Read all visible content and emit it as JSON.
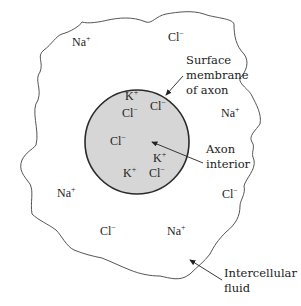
{
  "diagram": {
    "colors": {
      "outline": "#555555",
      "membrane": "#2a2a2a",
      "interior_fill": "#d6d6d6",
      "text": "#222222",
      "background": "#ffffff"
    },
    "extracellular_ions": [
      {
        "base": "Na",
        "charge": "+",
        "x": 72,
        "y": 46
      },
      {
        "base": "Cl",
        "charge": "−",
        "x": 168,
        "y": 41
      },
      {
        "base": "Na",
        "charge": "+",
        "x": 221,
        "y": 117
      },
      {
        "base": "Na",
        "charge": "+",
        "x": 57,
        "y": 197
      },
      {
        "base": "Cl",
        "charge": "−",
        "x": 100,
        "y": 235
      },
      {
        "base": "Na",
        "charge": "+",
        "x": 167,
        "y": 235
      },
      {
        "base": "Cl",
        "charge": "−",
        "x": 222,
        "y": 198
      }
    ],
    "intracellular_ions": [
      {
        "base": "K",
        "charge": "+",
        "x": 125,
        "y": 100
      },
      {
        "base": "Cl",
        "charge": "−",
        "x": 150,
        "y": 110
      },
      {
        "base": "Cl",
        "charge": "−",
        "x": 122,
        "y": 117
      },
      {
        "base": "Cl",
        "charge": "−",
        "x": 110,
        "y": 145
      },
      {
        "base": "K",
        "charge": "+",
        "x": 153,
        "y": 162
      },
      {
        "base": "K",
        "charge": "+",
        "x": 123,
        "y": 177
      },
      {
        "base": "Cl",
        "charge": "−",
        "x": 149,
        "y": 177
      }
    ],
    "labels": {
      "membrane": [
        "Surface",
        "membrane",
        "of axon"
      ],
      "interior": [
        "Axon",
        "interior"
      ],
      "fluid": [
        "Intercellular",
        "fluid"
      ]
    }
  }
}
